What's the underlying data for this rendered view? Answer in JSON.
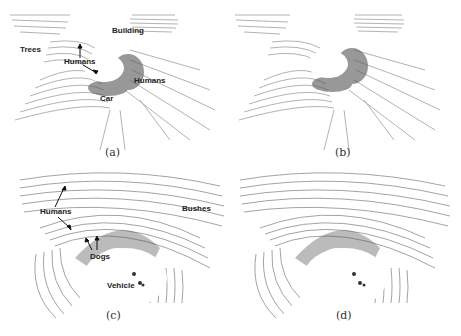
{
  "figure": {
    "panels": [
      {
        "id": "a",
        "caption": "(a)",
        "labels": {
          "trees": "Trees",
          "building": "Building",
          "humans_1": "Humans",
          "humans_2": "Humans",
          "car": "Car"
        }
      },
      {
        "id": "b",
        "caption": "(b)"
      },
      {
        "id": "c",
        "caption": "(c)",
        "labels": {
          "humans": "Humans",
          "bushes": "Bushes",
          "dogs": "Dogs",
          "vehicle": "Vehicle"
        }
      },
      {
        "id": "d",
        "caption": "(d)"
      }
    ]
  }
}
